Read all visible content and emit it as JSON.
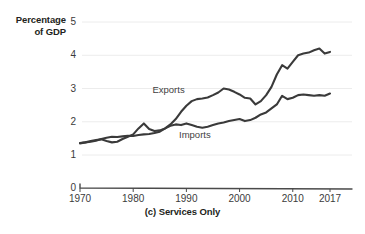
{
  "chart_data": {
    "type": "line",
    "title": "",
    "caption": "(c) Services Only",
    "ylabel": "Percentage of GDP",
    "xlabel": "",
    "grid": true,
    "legend_position": "inline-annotations",
    "xlim": [
      1970,
      2017
    ],
    "ylim": [
      0,
      5
    ],
    "y_axis_break": true,
    "y_break_note": "axis compressed between 0 and 1",
    "yticks": [
      5,
      4,
      3,
      2,
      1,
      0
    ],
    "ytick_labels": [
      "5",
      "4",
      "3",
      "2",
      "1",
      "0"
    ],
    "xticks": [
      1970,
      1980,
      1990,
      2000,
      2010,
      2017
    ],
    "xtick_labels": [
      "1970",
      "1980",
      "1990",
      "2000",
      "2010",
      "2017"
    ],
    "x": [
      1970,
      1971,
      1972,
      1973,
      1974,
      1975,
      1976,
      1977,
      1978,
      1979,
      1980,
      1981,
      1982,
      1983,
      1984,
      1985,
      1986,
      1987,
      1988,
      1989,
      1990,
      1991,
      1992,
      1993,
      1994,
      1995,
      1996,
      1997,
      1998,
      1999,
      2000,
      2001,
      2002,
      2003,
      2004,
      2005,
      2006,
      2007,
      2008,
      2009,
      2010,
      2011,
      2012,
      2013,
      2014,
      2015,
      2016,
      2017
    ],
    "series": [
      {
        "name": "Exports",
        "color": "#3a3a3a",
        "values": [
          1.35,
          1.38,
          1.4,
          1.43,
          1.48,
          1.52,
          1.55,
          1.54,
          1.56,
          1.58,
          1.57,
          1.6,
          1.62,
          1.63,
          1.66,
          1.7,
          1.8,
          1.92,
          2.08,
          2.3,
          2.48,
          2.62,
          2.68,
          2.7,
          2.73,
          2.8,
          2.88,
          3.0,
          2.97,
          2.9,
          2.82,
          2.72,
          2.7,
          2.52,
          2.62,
          2.8,
          3.05,
          3.42,
          3.7,
          3.6,
          3.8,
          4.0,
          4.05,
          4.08,
          4.15,
          4.2,
          4.05,
          4.1
        ]
      },
      {
        "name": "Imports",
        "color": "#3a3a3a",
        "values": [
          1.36,
          1.38,
          1.42,
          1.45,
          1.47,
          1.42,
          1.38,
          1.4,
          1.48,
          1.55,
          1.62,
          1.8,
          1.95,
          1.78,
          1.72,
          1.74,
          1.8,
          1.88,
          1.92,
          1.9,
          1.95,
          1.9,
          1.85,
          1.82,
          1.85,
          1.9,
          1.95,
          1.98,
          2.02,
          2.05,
          2.08,
          2.02,
          2.05,
          2.12,
          2.22,
          2.28,
          2.4,
          2.52,
          2.78,
          2.68,
          2.72,
          2.8,
          2.82,
          2.8,
          2.78,
          2.8,
          2.78,
          2.85
        ]
      }
    ],
    "annotations": [
      {
        "text": "Exports",
        "x": 1987,
        "y": 2.95
      },
      {
        "text": "Imports",
        "x": 1992,
        "y": 1.6
      }
    ],
    "colors": {
      "line": "#3a3a3a",
      "grid": "#ececec",
      "axis": "#4a4a4a",
      "text": "#231f20",
      "background": "#ffffff"
    }
  }
}
